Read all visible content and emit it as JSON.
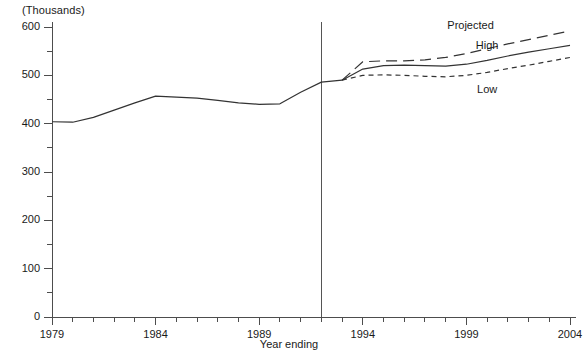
{
  "chart_data": {
    "type": "line",
    "title": "",
    "subtitle": "",
    "unit_label": "(Thousands)",
    "xlabel": "Year ending",
    "ylabel": "",
    "xlim": [
      1979,
      2004
    ],
    "ylim": [
      0,
      600
    ],
    "ytick_interval": 100,
    "yminor_interval": 50,
    "xtick_interval": 1,
    "xlabel_interval": 5,
    "grid": false,
    "legend_position": "inline-annotations",
    "ytick_labels": [
      "0",
      "100",
      "200",
      "300",
      "400",
      "500",
      "600"
    ],
    "ytick_values": [
      0,
      100,
      200,
      300,
      400,
      500,
      600
    ],
    "xtick_labels": [
      "1979",
      "1984",
      "1989",
      "1994",
      "1999",
      "2004"
    ],
    "xtick_values": [
      1979,
      1984,
      1989,
      1994,
      1999,
      2004
    ],
    "annotations": [
      {
        "text": "Projected",
        "x": 1999.2,
        "y": 600
      },
      {
        "text": "High",
        "x": 2000.0,
        "y": 558
      },
      {
        "text": "Low",
        "x": 2000.0,
        "y": 468
      }
    ],
    "divider": {
      "x": 1992,
      "label": "",
      "y_top": 600
    },
    "series": [
      {
        "name": "Actual",
        "style": "solid",
        "x": [
          1979,
          1980,
          1981,
          1982,
          1983,
          1984,
          1985,
          1986,
          1987,
          1988,
          1989,
          1990,
          1991,
          1992,
          1993
        ],
        "values": [
          404,
          403,
          413,
          428,
          443,
          457,
          455,
          453,
          448,
          443,
          440,
          441,
          465,
          486,
          490
        ]
      },
      {
        "name": "Projected High",
        "style": "dashed",
        "x": [
          1993,
          1994,
          1995,
          1996,
          1997,
          1998,
          1999,
          2000,
          2001,
          2002,
          2003,
          2004
        ],
        "values": [
          490,
          528,
          530,
          530,
          532,
          537,
          545,
          555,
          565,
          574,
          583,
          592
        ]
      },
      {
        "name": "Projected Middle",
        "style": "solid",
        "x": [
          1993,
          1994,
          1995,
          1996,
          1997,
          1998,
          1999,
          2000,
          2001,
          2002,
          2003,
          2004
        ],
        "values": [
          490,
          513,
          520,
          521,
          520,
          519,
          523,
          531,
          540,
          548,
          555,
          562
        ]
      },
      {
        "name": "Projected Low",
        "style": "dotted",
        "x": [
          1993,
          1994,
          1995,
          1996,
          1997,
          1998,
          1999,
          2000,
          2001,
          2002,
          2003,
          2004
        ],
        "values": [
          490,
          500,
          501,
          500,
          498,
          497,
          500,
          506,
          514,
          521,
          529,
          537
        ]
      }
    ],
    "colors": {
      "axis": "#4d4d4d",
      "line": "#333333",
      "text": "#1a1a1a",
      "background": "#ffffff"
    }
  }
}
